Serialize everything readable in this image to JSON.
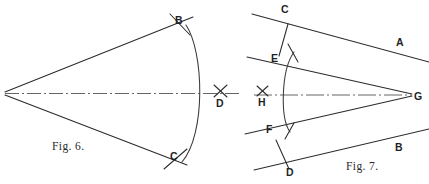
{
  "figure": {
    "kind": "technical-drawing",
    "page_background": "#ffffff",
    "ink_color": "#2b2b2b",
    "captions": {
      "fig6": "Fig. 6.",
      "fig7": "Fig. 7."
    }
  },
  "fig6": {
    "caption": "Fig. 6.",
    "description": "Angle with apex at left, two rays opening to the right, an arc struck across both rays, and a dash-dot centre line running through the apex to a cross-mark at D.",
    "labels": {
      "B": "B",
      "C": "C",
      "D": "D"
    },
    "points": {
      "apex": {
        "x": 5,
        "y": 93
      },
      "B": {
        "x": 179,
        "y": 22
      },
      "C": {
        "x": 174,
        "y": 158
      },
      "D": {
        "x": 221,
        "y": 105
      }
    },
    "ray_upper": {
      "x1": 5,
      "y1": 92,
      "x2": 192,
      "y2": 17
    },
    "ray_lower": {
      "x1": 5,
      "y1": 95,
      "x2": 186,
      "y2": 164
    },
    "arc": {
      "start_x": 186,
      "start_y": 25,
      "end_x": 182,
      "end_y": 161,
      "bulge_x": 210,
      "bulge_y": 94
    },
    "centre_line": {
      "x1": 5,
      "y1": 93,
      "x2": 238,
      "y2": 93,
      "style": "dash-dot"
    },
    "cross_mark": {
      "x": 221,
      "y": 92
    },
    "tick_B": {
      "x1": 171,
      "y1": 15,
      "x2": 190,
      "y2": 34
    },
    "tick_C": {
      "x1": 165,
      "y1": 168,
      "x2": 186,
      "y2": 150
    }
  },
  "fig7": {
    "caption": "Fig. 7.",
    "description": "Two given lines A and B converging to the right at G, with parallel offset lines through C-E and F-D, an arc struck about G, and a cross-mark at H on the dash-dot bisector.",
    "labels": {
      "C": "C",
      "A": "A",
      "E": "E",
      "H": "H",
      "G": "G",
      "F": "F",
      "D": "D",
      "B": "B"
    },
    "points": {
      "vertex_G": {
        "x": 412,
        "y": 95
      },
      "C": {
        "x": 285,
        "y": 12
      },
      "E": {
        "x": 275,
        "y": 60
      },
      "F": {
        "x": 271,
        "y": 132
      },
      "D": {
        "x": 290,
        "y": 175
      },
      "H": {
        "x": 263,
        "y": 104
      },
      "A_label": {
        "x": 400,
        "y": 44
      },
      "B_label": {
        "x": 399,
        "y": 150
      }
    },
    "line_A": {
      "x1": 253,
      "y1": 15,
      "x2": 429,
      "y2": 62,
      "label": "A"
    },
    "line_B": {
      "x1": 255,
      "y1": 169,
      "x2": 429,
      "y2": 130,
      "label": "B"
    },
    "line_CE_offset_upper": {
      "x1": 248,
      "y1": 57,
      "x2": 412,
      "y2": 94
    },
    "line_FD_offset_lower": {
      "x1": 246,
      "y1": 133,
      "x2": 412,
      "y2": 96
    },
    "segment_CE": {
      "x1": 287,
      "y1": 24,
      "x2": 278,
      "y2": 55
    },
    "segment_FD": {
      "x1": 276,
      "y1": 140,
      "x2": 288,
      "y2": 168
    },
    "arc": {
      "start_x": 293,
      "start_y": 52,
      "end_x": 289,
      "end_y": 131,
      "bulge_x": 281,
      "bulge_y": 94
    },
    "centre_line": {
      "x1": 255,
      "y1": 95,
      "x2": 412,
      "y2": 95,
      "style": "dash-dot"
    },
    "cross_mark": {
      "x": 263,
      "y": 92
    },
    "tick_upper": {
      "x1": 288,
      "y1": 45,
      "x2": 297,
      "y2": 60
    },
    "tick_lower": {
      "x1": 285,
      "y1": 138,
      "x2": 293,
      "y2": 124
    }
  }
}
